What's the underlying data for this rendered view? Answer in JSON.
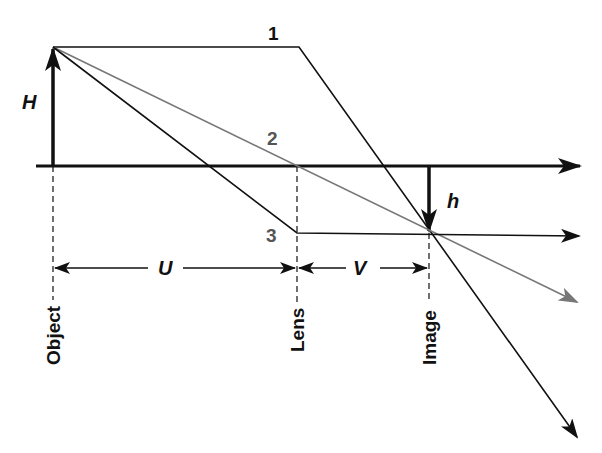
{
  "colors": {
    "background": "#ffffff",
    "primary": "#111111",
    "ray_gray": "#777777",
    "label_gray": "#555555"
  },
  "labels": {
    "object_height": "H",
    "image_height": "h",
    "object_distance": "U",
    "image_distance": "V",
    "object": "Object",
    "lens": "Lens",
    "image": "Image"
  },
  "rays": [
    {
      "id": "1",
      "label": "1",
      "description": "Parallel ray refracted through focal point",
      "color": "#111111"
    },
    {
      "id": "2",
      "label": "2",
      "description": "Central ray through lens center, undeviated",
      "color": "#777777"
    },
    {
      "id": "3",
      "label": "3",
      "description": "Ray through front focal point, exits parallel",
      "color": "#111111"
    }
  ],
  "geometry": {
    "axis_y": 166,
    "object_x": 53,
    "object_top_y": 47,
    "lens_x": 297,
    "image_x": 429,
    "image_tip_y": 233
  }
}
